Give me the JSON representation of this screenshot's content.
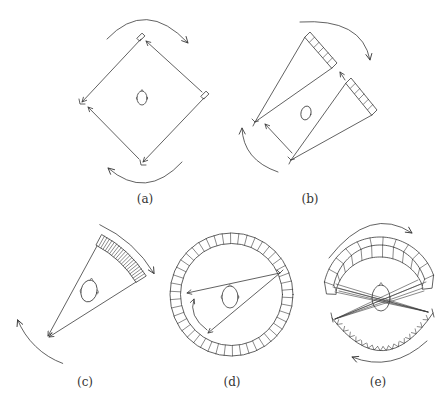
{
  "figure": {
    "background": "#ffffff",
    "stroke_color": "#3a3a3a",
    "panels": {
      "a": {
        "label": "(a)",
        "elements": [
          "x-ray-source-icon",
          "x-ray-source-icon",
          "detector-icon",
          "detector-icon",
          "head-outline",
          "rotation-arrow-clockwise",
          "rotation-arrow-counterclockwise",
          "ray-line",
          "translation-arrow"
        ]
      },
      "b": {
        "label": "(b)",
        "elements": [
          "x-ray-source-icon",
          "x-ray-source-icon",
          "detector-array",
          "detector-array",
          "head-outline",
          "rotation-arrow-clockwise",
          "rotation-arrow-counterclockwise",
          "ray-line",
          "translation-arrow"
        ],
        "detector_cells_per_array": 6
      },
      "c": {
        "label": "(c)",
        "elements": [
          "x-ray-source-icon",
          "curved-detector-array",
          "fan-beam",
          "head-outline",
          "rotation-arrow-clockwise",
          "rotation-arrow-counterclockwise"
        ],
        "detector_cells": 21
      },
      "d": {
        "label": "(d)",
        "elements": [
          "stationary-detector-ring",
          "x-ray-source-icon",
          "fan-beam",
          "head-outline",
          "source-motion-arrow"
        ],
        "detector_cells": 46
      },
      "e": {
        "label": "(e)",
        "elements": [
          "detector-arch",
          "source-arc",
          "fan-beams",
          "head-outline",
          "rotation-arrow-clockwise",
          "rotation-arrow-counterclockwise"
        ],
        "detector_cells": 11,
        "source_marks": 16
      }
    }
  }
}
